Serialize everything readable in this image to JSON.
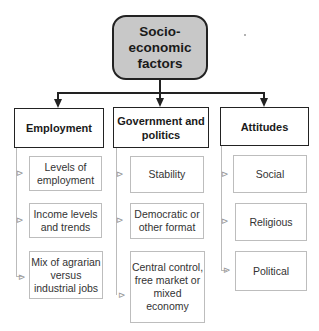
{
  "root": {
    "label_lines": [
      "Socio-",
      "economic",
      "factors"
    ],
    "fill": "#c8c8c8"
  },
  "categories": [
    {
      "label": "Employment",
      "items": [
        "Levels of employment",
        "Income levels and trends",
        "Mix of agrarian versus industrial jobs"
      ]
    },
    {
      "label": "Government and politics",
      "items": [
        "Stability",
        "Democratic or other format",
        "Central control, free market or mixed economy"
      ]
    },
    {
      "label": "Attitudes",
      "items": [
        "Social",
        "Religious",
        "Political"
      ]
    }
  ],
  "connector_glyph": "⊳"
}
